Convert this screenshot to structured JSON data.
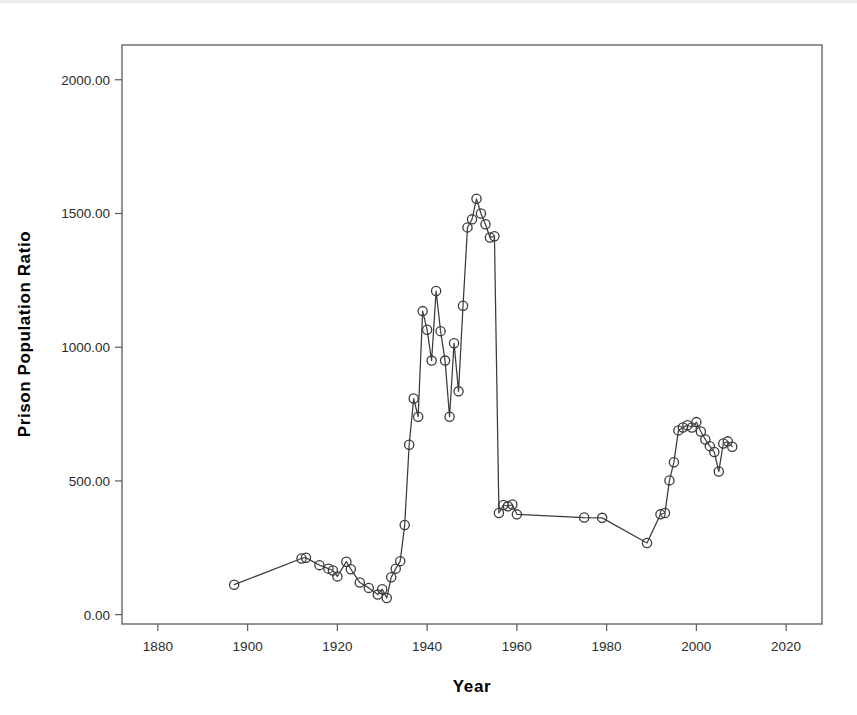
{
  "chart_data": {
    "type": "line",
    "title": "",
    "xlabel": "Year",
    "ylabel": "Prison Population Ratio",
    "xlim": [
      1872,
      2028
    ],
    "ylim": [
      -35,
      2130
    ],
    "grid": false,
    "legend": "none",
    "marker": "open-circle",
    "line_color": "#3a3a3a",
    "marker_fill": "#ffffff",
    "xticks": [
      "1880",
      "1900",
      "1920",
      "1940",
      "1960",
      "1980",
      "2000",
      "2020"
    ],
    "xtick_values": [
      1880,
      1900,
      1920,
      1940,
      1960,
      1980,
      2000,
      2020
    ],
    "yticks": [
      "0.00",
      "500.00",
      "1000.00",
      "1500.00",
      "2000.00"
    ],
    "ytick_values": [
      0,
      500,
      1000,
      1500,
      2000
    ],
    "series": [
      {
        "name": "Prison Population Ratio",
        "x": [
          1897,
          1912,
          1913,
          1916,
          1918,
          1919,
          1920,
          1922,
          1923,
          1925,
          1927,
          1929,
          1930,
          1931,
          1932,
          1933,
          1934,
          1935,
          1936,
          1937,
          1938,
          1939,
          1940,
          1941,
          1942,
          1943,
          1944,
          1945,
          1946,
          1947,
          1948,
          1949,
          1950,
          1951,
          1952,
          1953,
          1954,
          1955,
          1956,
          1957,
          1958,
          1959,
          1960,
          1975,
          1979,
          1989,
          1992,
          1993,
          1994,
          1995,
          1996,
          1997,
          1998,
          1999,
          2000,
          2001,
          2002,
          2003,
          2004,
          2005,
          2006,
          2007,
          2008
        ],
        "y": [
          112,
          210,
          213,
          185,
          172,
          165,
          143,
          198,
          170,
          120,
          100,
          75,
          95,
          62,
          140,
          172,
          200,
          335,
          635,
          808,
          740,
          1135,
          1065,
          950,
          1210,
          1060,
          950,
          740,
          1015,
          835,
          1155,
          1448,
          1478,
          1555,
          1500,
          1460,
          1410,
          1415,
          380,
          410,
          405,
          412,
          375,
          363,
          362,
          268,
          375,
          380,
          502,
          570,
          689,
          700,
          708,
          700,
          720,
          685,
          655,
          630,
          608,
          535,
          640,
          648,
          628
        ]
      }
    ]
  },
  "axes": {
    "x_title": "Year",
    "y_title": "Prison Population Ratio"
  }
}
